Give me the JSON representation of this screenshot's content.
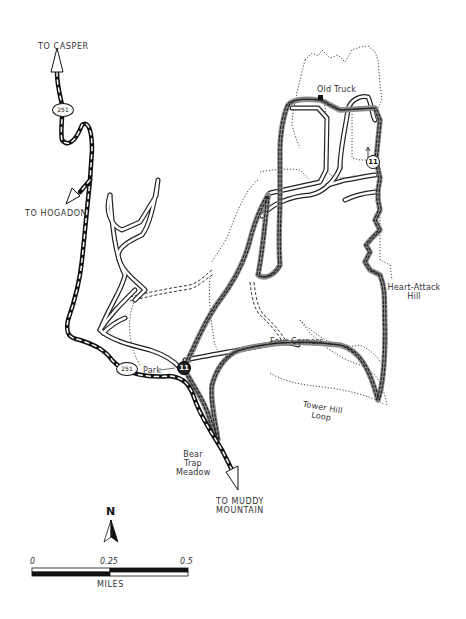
{
  "map": {
    "destinations": {
      "casper": "TO CASPER",
      "hogadon": "TO HOGADON",
      "muddy_mountain_line1": "TO MUDDY",
      "muddy_mountain_line2": "MOUNTAIN"
    },
    "highway_shield": "251",
    "landmarks": {
      "old_truck": "Old Truck",
      "park": "Park",
      "four_corners": "Four Corners",
      "heart_attack_line1": "Heart-Attack",
      "heart_attack_line2": "Hill",
      "tower_hill_line1": "Tower Hill",
      "tower_hill_line2": "Loop",
      "bear_trap_line1": "Bear",
      "bear_trap_line2": "Trap",
      "bear_trap_line3": "Meadow"
    },
    "trail_markers": {
      "trailhead": "11",
      "upper": "11"
    },
    "north_arrow": "N",
    "scale_bar": {
      "ticks": [
        "0",
        "0.25",
        "0.5"
      ],
      "unit": "MILES"
    },
    "colors": {
      "highway": "#111111",
      "featured_trail": "#8a8a8a",
      "road": "#222222",
      "path": "#555555"
    }
  }
}
